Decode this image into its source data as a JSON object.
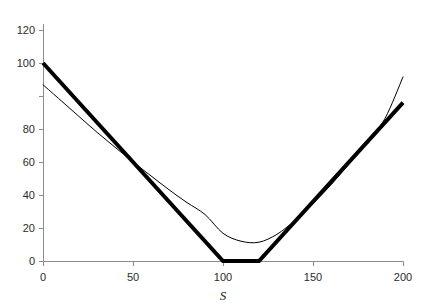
{
  "chart_data": {
    "type": "line",
    "title": "",
    "subtitle": "",
    "xlabel": "S",
    "ylabel": "",
    "xlim": [
      0,
      200
    ],
    "ylim": [
      0,
      120
    ],
    "xticks": [
      0,
      50,
      100,
      150,
      200
    ],
    "yticks": [
      0,
      20,
      40,
      60,
      80,
      100,
      120
    ],
    "xtick_labels": [
      "0",
      "50",
      "100",
      "150",
      "200"
    ],
    "ytick_labels": [
      "0",
      "20",
      "40",
      "60",
      "80",
      "100",
      "120"
    ],
    "grid": false,
    "legend": null,
    "legend_position": "none",
    "annotations": [],
    "series": [
      {
        "name": "payoff-at-expiry",
        "style": "thick-solid",
        "color": "#000000",
        "linewidth": 4,
        "shape": "piecewise-linear",
        "x": [
          0,
          100,
          120,
          200
        ],
        "values": [
          100,
          0,
          0,
          80
        ]
      },
      {
        "name": "current-value",
        "style": "thin-solid",
        "color": "#000000",
        "linewidth": 1,
        "shape": "smooth-convex",
        "x": [
          0,
          10,
          20,
          30,
          40,
          50,
          60,
          70,
          80,
          90,
          100,
          110,
          120,
          130,
          140,
          150,
          160,
          170,
          180,
          190,
          200
        ],
        "values": [
          89,
          81,
          73,
          65,
          57.5,
          50,
          43,
          36,
          29.5,
          23.5,
          14,
          10,
          9.5,
          13.5,
          20.5,
          29,
          38.5,
          49,
          60,
          72,
          93
        ]
      }
    ]
  },
  "figure": {
    "background_color": "#ffffff",
    "axis_color": "#808080",
    "line_color": "#000000",
    "text_color": "#2b2b2b"
  }
}
